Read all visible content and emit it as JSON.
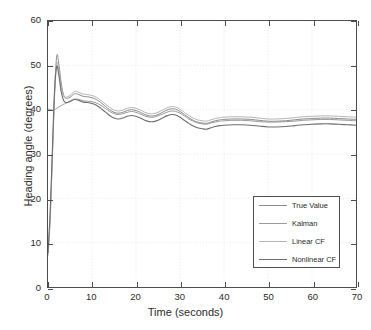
{
  "chart_data": {
    "type": "line",
    "title": "",
    "xlabel": "Time (seconds)",
    "ylabel": "Heading angle (degrees)",
    "xlim": [
      0,
      70
    ],
    "ylim": [
      0,
      60
    ],
    "xticks": [
      0,
      10,
      20,
      30,
      40,
      50,
      60,
      70
    ],
    "yticks": [
      0,
      10,
      20,
      30,
      40,
      50,
      60
    ],
    "grid": true,
    "legend_position": "lower-right",
    "series": [
      {
        "name": "True Value",
        "color": "#8c8c8c",
        "width": 1.0,
        "x": [
          0,
          0.5,
          1,
          1.5,
          2,
          2.5,
          3,
          3.5,
          4,
          5,
          6,
          7,
          8,
          9,
          10,
          11,
          12,
          13,
          14,
          15,
          16,
          17,
          18,
          19,
          20,
          21,
          22,
          23,
          24,
          25,
          26,
          27,
          28,
          29,
          30,
          31,
          32,
          33,
          34,
          35,
          36,
          37,
          38,
          39,
          40,
          42,
          44,
          46,
          48,
          50,
          52,
          54,
          56,
          58,
          60,
          62,
          64,
          66,
          68,
          70
        ],
        "y": [
          7.5,
          16,
          30,
          44,
          52.2,
          50,
          46,
          43.5,
          42.6,
          42.8,
          43.6,
          43.4,
          43.0,
          42.9,
          42.7,
          42.3,
          41.6,
          40.8,
          40.0,
          39.4,
          39.2,
          39.4,
          39.8,
          40.0,
          39.8,
          39.4,
          38.9,
          38.6,
          38.6,
          38.9,
          39.4,
          39.9,
          40.2,
          40.1,
          39.6,
          38.9,
          38.2,
          37.6,
          37.2,
          37.0,
          36.9,
          37.2,
          37.5,
          37.7,
          37.8,
          37.9,
          37.9,
          37.8,
          37.6,
          37.4,
          37.4,
          37.5,
          37.7,
          37.9,
          38.0,
          38.1,
          38.1,
          38.0,
          37.9,
          37.8
        ]
      },
      {
        "name": "Kalman",
        "color": "#9a9a9a",
        "width": 1.0,
        "x": [
          0,
          0.5,
          1,
          1.5,
          2,
          2.5,
          3,
          3.5,
          4,
          5,
          6,
          7,
          8,
          9,
          10,
          11,
          12,
          13,
          14,
          15,
          16,
          17,
          18,
          19,
          20,
          21,
          22,
          23,
          24,
          25,
          26,
          27,
          28,
          29,
          30,
          31,
          32,
          33,
          34,
          35,
          36,
          37,
          38,
          39,
          40,
          42,
          44,
          46,
          48,
          50,
          52,
          54,
          56,
          58,
          60,
          62,
          64,
          66,
          68,
          70
        ],
        "y": [
          40.2,
          40.0,
          39.9,
          40.0,
          40.3,
          40.6,
          40.9,
          41.2,
          41.4,
          42.0,
          42.4,
          42.3,
          42.0,
          41.9,
          41.8,
          41.5,
          41.0,
          40.3,
          39.6,
          39.1,
          38.9,
          39.1,
          39.4,
          39.6,
          39.4,
          39.0,
          38.6,
          38.3,
          38.3,
          38.6,
          39.0,
          39.4,
          39.7,
          39.6,
          39.2,
          38.6,
          37.9,
          37.4,
          37.0,
          36.8,
          36.7,
          37.0,
          37.2,
          37.4,
          37.5,
          37.6,
          37.6,
          37.5,
          37.3,
          37.2,
          37.2,
          37.3,
          37.4,
          37.6,
          37.7,
          37.8,
          37.8,
          37.7,
          37.6,
          37.5
        ]
      },
      {
        "name": "Linear CF",
        "color": "#b5b5b5",
        "width": 1.0,
        "x": [
          0,
          0.5,
          1,
          1.5,
          2,
          2.5,
          3,
          3.5,
          4,
          5,
          6,
          7,
          8,
          9,
          10,
          11,
          12,
          13,
          14,
          15,
          16,
          17,
          18,
          19,
          20,
          21,
          22,
          23,
          24,
          25,
          26,
          27,
          28,
          29,
          30,
          31,
          32,
          33,
          34,
          35,
          36,
          37,
          38,
          39,
          40,
          42,
          44,
          46,
          48,
          50,
          52,
          54,
          56,
          58,
          60,
          62,
          64,
          66,
          68,
          70
        ],
        "y": [
          7.0,
          15,
          29,
          43,
          50.5,
          48.5,
          45,
          43.2,
          42.8,
          43.2,
          44.1,
          43.9,
          43.5,
          43.4,
          43.2,
          42.8,
          42.1,
          41.3,
          40.5,
          39.9,
          39.7,
          39.9,
          40.3,
          40.5,
          40.3,
          39.9,
          39.4,
          39.1,
          39.1,
          39.4,
          39.9,
          40.4,
          40.7,
          40.6,
          40.1,
          39.4,
          38.7,
          38.1,
          37.7,
          37.5,
          37.4,
          37.7,
          38.0,
          38.2,
          38.3,
          38.4,
          38.4,
          38.3,
          38.1,
          37.9,
          37.9,
          38.0,
          38.2,
          38.4,
          38.5,
          38.6,
          38.6,
          38.5,
          38.4,
          38.3
        ]
      },
      {
        "name": "Nonlinear CF",
        "color": "#6e6e6e",
        "width": 1.1,
        "x": [
          0,
          0.5,
          1,
          1.5,
          2,
          2.5,
          3,
          3.5,
          4,
          5,
          6,
          7,
          8,
          9,
          10,
          11,
          12,
          13,
          14,
          15,
          16,
          17,
          18,
          19,
          20,
          21,
          22,
          23,
          24,
          25,
          26,
          27,
          28,
          29,
          30,
          31,
          32,
          33,
          34,
          35,
          36,
          37,
          38,
          39,
          40,
          42,
          44,
          46,
          48,
          50,
          52,
          54,
          56,
          58,
          60,
          62,
          64,
          66,
          68,
          70
        ],
        "y": [
          7.8,
          17,
          31,
          44.5,
          49.8,
          47.5,
          44,
          42.2,
          41.6,
          41.8,
          42.3,
          42.1,
          41.7,
          41.6,
          41.4,
          41.0,
          40.3,
          39.5,
          38.7,
          38.1,
          37.9,
          38.1,
          38.5,
          38.7,
          38.5,
          38.1,
          37.6,
          37.3,
          37.3,
          37.6,
          38.1,
          38.6,
          38.9,
          38.8,
          38.3,
          37.6,
          36.9,
          36.3,
          35.9,
          35.7,
          35.6,
          35.9,
          36.2,
          36.4,
          36.5,
          36.6,
          36.6,
          36.5,
          36.3,
          36.1,
          36.1,
          36.2,
          36.4,
          36.6,
          36.7,
          36.8,
          36.8,
          36.7,
          36.6,
          36.5
        ]
      }
    ]
  },
  "axes": {
    "x_tick_labels": [
      "0",
      "10",
      "20",
      "30",
      "40",
      "50",
      "60",
      "70"
    ],
    "y_tick_labels": [
      "0",
      "10",
      "20",
      "30",
      "40",
      "50",
      "60"
    ],
    "x_title": "Time (seconds)",
    "y_title": "Heading angle (degrees)"
  },
  "legend": {
    "entries": [
      {
        "label": "True Value",
        "color": "#8c8c8c"
      },
      {
        "label": "Kalman",
        "color": "#9a9a9a"
      },
      {
        "label": "Linear CF",
        "color": "#b5b5b5"
      },
      {
        "label": "Nonlinear CF",
        "color": "#6e6e6e"
      }
    ]
  },
  "colors": {
    "axis": "#4d4d4d",
    "grid": "#e8e8e8",
    "background": "#ffffff",
    "text": "#2b2b2b"
  }
}
